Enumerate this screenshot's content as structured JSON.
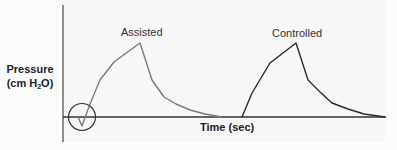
{
  "diagram": {
    "type": "ventilator-pressure-waveform",
    "y_axis": {
      "label_line1": "Pressure",
      "label_line2_prefix": "(cm H",
      "label_line2_sub": "2",
      "label_line2_suffix": "O)"
    },
    "x_axis": {
      "label": "Time (sec)"
    },
    "curves": [
      {
        "name": "Assisted",
        "label": "Assisted",
        "color": "#7a7a7a",
        "note": "negative deflection (patient-triggered) circled at start"
      },
      {
        "name": "Controlled",
        "label": "Controlled",
        "color": "#2a2a2a"
      }
    ],
    "annotation": {
      "shape": "circle",
      "target": "assisted-trigger-dip"
    },
    "colors": {
      "axis": "#333333",
      "background": "#f7f7f7"
    }
  }
}
